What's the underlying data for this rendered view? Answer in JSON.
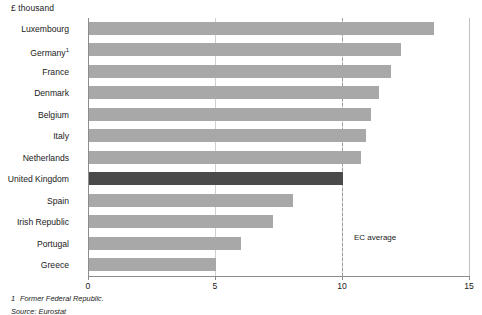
{
  "units_label": "£ thousand",
  "annotation": {
    "ec_average_label": "EC average",
    "ec_average_value": 10
  },
  "footnotes": [
    {
      "marker": "1",
      "text": "Former Federal Republic."
    },
    {
      "marker": "",
      "text": "Source: Eurostat"
    }
  ],
  "chart_data": {
    "type": "bar",
    "orientation": "horizontal",
    "title": "",
    "subtitle": "",
    "xlabel": "£ thousand",
    "ylabel": "",
    "xlim": [
      0,
      15
    ],
    "xticks": [
      0,
      5,
      10,
      15
    ],
    "xtick_labels": [
      "0",
      "5",
      "10",
      "15"
    ],
    "grid": true,
    "legend": "none",
    "highlight_category": "United Kingdom",
    "colors": {
      "bar": "#a8a8a8",
      "bar_highlight": "#4a4a4a",
      "axis": "#8c8c8c",
      "gridline": "#d0d0d0",
      "ec_average_line": "#9a9a9a",
      "text": "#1a1a1a",
      "background": "#ffffff"
    },
    "categories": [
      "Luxembourg",
      "Germany",
      "France",
      "Denmark",
      "Belgium",
      "Italy",
      "Netherlands",
      "United Kingdom",
      "Spain",
      "Irish Republic",
      "Portugal",
      "Greece"
    ],
    "category_labels": [
      "Luxembourg",
      "Germany¹",
      "France",
      "Denmark",
      "Belgium",
      "Italy",
      "Netherlands",
      "United Kingdom",
      "Spain",
      "Irish Republic",
      "Portugal",
      "Greece"
    ],
    "values": [
      13.6,
      12.3,
      11.9,
      11.4,
      11.1,
      10.9,
      10.7,
      10.0,
      8.05,
      7.25,
      6.0,
      5.0
    ],
    "annotations": [
      {
        "label": "EC average",
        "x": 10,
        "style": "dashed-vertical-line"
      }
    ]
  }
}
